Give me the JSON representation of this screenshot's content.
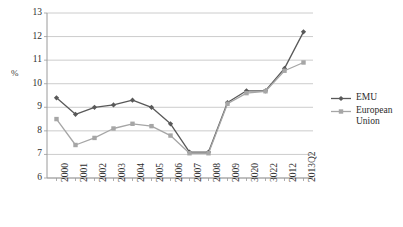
{
  "chart_data": {
    "type": "line",
    "title": "",
    "subtitle": "",
    "xlabel": "",
    "ylabel": "%",
    "ylim": [
      6,
      13
    ],
    "ytick_values": [
      6,
      7,
      8,
      9,
      10,
      11,
      12,
      13
    ],
    "ytick_labels": [
      "6",
      "7",
      "8",
      "9",
      "10",
      "11",
      "12",
      "13"
    ],
    "grid": true,
    "grid_axis": "y",
    "legend_position": "right",
    "categories": [
      "2000",
      "2001",
      "2002",
      "2003",
      "2004",
      "2005",
      "2006",
      "2007",
      "2008",
      "2009",
      "3020",
      "3022",
      "2012",
      "2013Q2"
    ],
    "series": [
      {
        "name": "EMU",
        "color": "#595959",
        "marker": "diamond",
        "values": [
          9.4,
          8.7,
          9.0,
          9.1,
          9.3,
          9.0,
          8.3,
          7.1,
          7.1,
          9.2,
          9.7,
          9.7,
          10.65,
          12.2
        ]
      },
      {
        "name": "European Union",
        "color": "#a6a6a6",
        "marker": "square",
        "values": [
          8.5,
          7.4,
          7.7,
          8.1,
          8.3,
          8.2,
          7.8,
          7.05,
          7.05,
          9.15,
          9.6,
          9.68,
          10.55,
          10.9
        ]
      }
    ]
  },
  "legend": {
    "entries": [
      {
        "label": "EMU"
      },
      {
        "label": "European Union"
      }
    ]
  },
  "axes": {
    "y_unit_label": "%"
  }
}
